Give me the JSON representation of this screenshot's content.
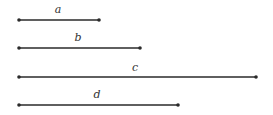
{
  "diagram": {
    "title": "",
    "segments": [
      {
        "label": "a",
        "x1": 19,
        "x2": 99,
        "y": 20,
        "label_x": 58,
        "label_y": 13
      },
      {
        "label": "b",
        "x1": 19,
        "x2": 140,
        "y": 48,
        "label_x": 78,
        "label_y": 41
      },
      {
        "label": "c",
        "x1": 19,
        "x2": 256,
        "y": 77,
        "label_x": 135,
        "label_y": 71
      },
      {
        "label": "d",
        "x1": 19,
        "x2": 178,
        "y": 105,
        "label_x": 97,
        "label_y": 98
      }
    ],
    "colors": {
      "line": "#2a2a2a",
      "background": "#ffffff"
    }
  }
}
